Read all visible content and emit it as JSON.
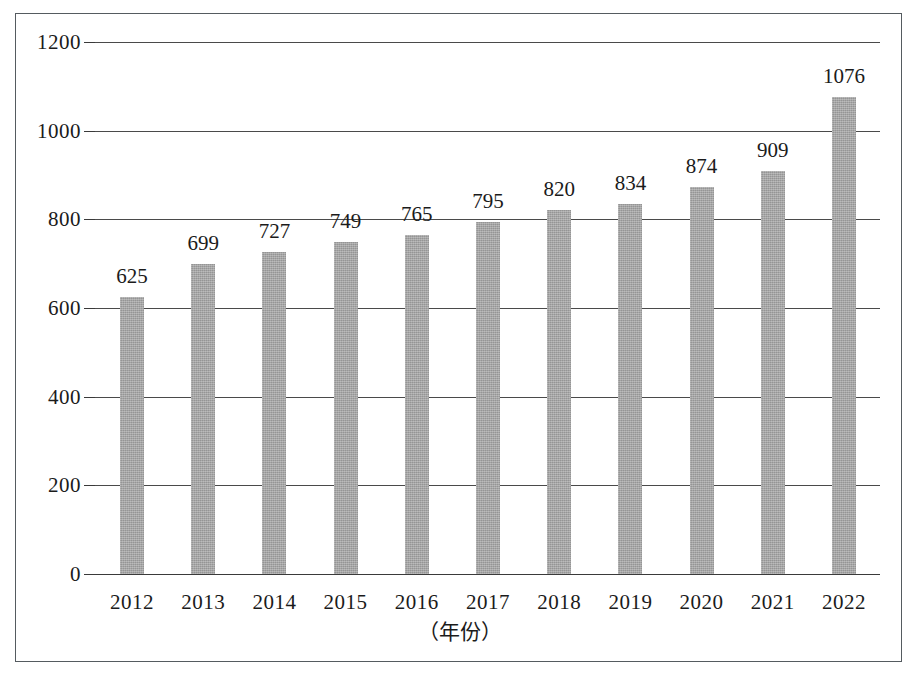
{
  "chart_data": {
    "type": "bar",
    "title": "",
    "subtitle": "",
    "xlabel": "（年份）",
    "ylabel": "",
    "categories": [
      "2012",
      "2013",
      "2014",
      "2015",
      "2016",
      "2017",
      "2018",
      "2019",
      "2020",
      "2021",
      "2022"
    ],
    "values": [
      625,
      699,
      727,
      749,
      765,
      795,
      820,
      834,
      874,
      909,
      1076
    ],
    "data_labels": [
      "625",
      "699",
      "727",
      "749",
      "765",
      "795",
      "820",
      "834",
      "874",
      "909",
      "1076"
    ],
    "ylim": [
      0,
      1200
    ],
    "y_ticks": [
      0,
      200,
      400,
      600,
      800,
      1000,
      1200
    ],
    "y_tick_labels": [
      "0",
      "200",
      "400",
      "600",
      "800",
      "1000",
      "1200"
    ],
    "grid": true,
    "grid_axis": "y",
    "legend": null,
    "legend_position": "none",
    "series": [
      {
        "name": "",
        "values": [
          625,
          699,
          727,
          749,
          765,
          795,
          820,
          834,
          874,
          909,
          1076
        ]
      }
    ],
    "colors": {
      "bar_fill": "#a3a3a3",
      "gridline": "#4a4a4a",
      "axis_text": "#1b1b1b",
      "frame_border": "#555b60",
      "background": "#ffffff"
    }
  }
}
